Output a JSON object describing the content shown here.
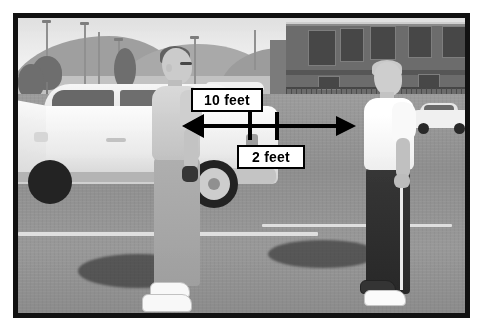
{
  "figure": {
    "kind": "annotated-photograph",
    "border_color": "#111111",
    "background_color": "#ffffff"
  },
  "annotations": {
    "primary_label": "10 feet",
    "secondary_label": "2 feet",
    "arrow": {
      "name": "double-headed-distance-arrow",
      "direction": "both",
      "color": "#000000"
    },
    "ticks": [
      {
        "name": "tick-mark-left"
      },
      {
        "name": "tick-mark-right"
      }
    ],
    "callout_box": {
      "fill": "#ffffff",
      "stroke": "#000000",
      "text_color": "#000000"
    }
  },
  "scene": {
    "subjects": [
      {
        "name": "person-left",
        "clothing_top": "light gray t-shirt",
        "clothing_bottom": "khaki pants",
        "shoes": "white sneakers"
      },
      {
        "name": "person-right",
        "clothing_top": "white t-shirt",
        "clothing_bottom": "dark track pants with white stripe",
        "shoes": "white sneakers"
      }
    ],
    "vehicles": [
      {
        "name": "white-suv",
        "position": "left",
        "door": "open"
      },
      {
        "name": "white-sedan",
        "position": "far-right-background"
      }
    ],
    "background": [
      {
        "name": "mountains"
      },
      {
        "name": "warehouse-building"
      },
      {
        "name": "chain-link-fence"
      },
      {
        "name": "light-poles"
      },
      {
        "name": "trees"
      }
    ],
    "ground": {
      "name": "asphalt-parking-lot",
      "marking": "white parking stripe"
    }
  }
}
